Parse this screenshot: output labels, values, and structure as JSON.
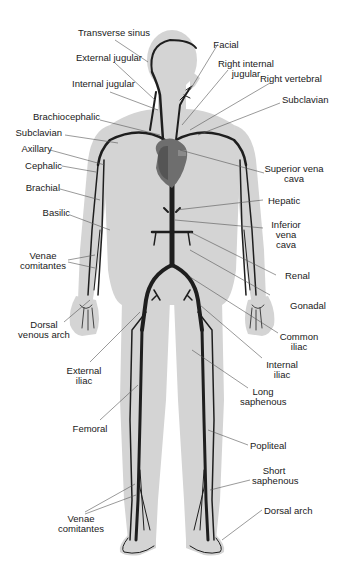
{
  "diagram": {
    "colors": {
      "body": "#d4d4d4",
      "heart": "#6e6e6e",
      "veins": "#1e1e1e",
      "leader_lines": "#555555",
      "background": "#ffffff"
    },
    "labels": {
      "transverse_sinus": "Transverse sinus",
      "external_jugular": "External jugular",
      "internal_jugular": "Internal jugular",
      "brachiocephalic": "Brachiocephalic",
      "subclavian_left": "Subclavian",
      "axillary": "Axillary",
      "cephalic": "Cephalic",
      "brachial": "Brachial",
      "basilic": "Basilic",
      "venae_comitantes_arm": "Venae comitantes",
      "dorsal_venous_arch": "Dorsal venous arch",
      "external_iliac": "External iliac",
      "femoral": "Femoral",
      "venae_comitantes_leg": "Venae comitantes",
      "facial": "Facial",
      "right_internal_jugular": "Right internal jugular",
      "right_vertebral": "Right vertebral",
      "subclavian_right": "Subclavian",
      "superior_vena_cava": "Superior vena cava",
      "hepatic": "Hepatic",
      "inferior_vena_cava": "Inferior vena cava",
      "renal": "Renal",
      "gonadal": "Gonadal",
      "common_iliac": "Common iliac",
      "internal_iliac": "Internal iliac",
      "long_saphenous": "Long saphenous",
      "popliteal": "Popliteal",
      "short_saphenous": "Short saphenous",
      "dorsal_arch": "Dorsal arch"
    }
  }
}
